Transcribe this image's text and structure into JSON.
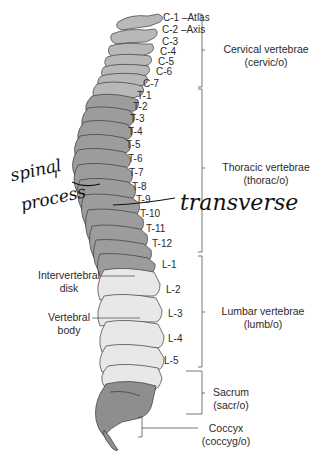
{
  "diagram": {
    "vertebra_labels": {
      "cervical": [
        "C-1 –Atlas",
        "C-2 –Axis",
        "C-3",
        "C-4",
        "C-5",
        "C-6",
        "C-7"
      ],
      "thoracic": [
        "T-1",
        "T-2",
        "T-3",
        "T-4",
        "T-5",
        "T-6",
        "T-7",
        "T-8",
        "T-9",
        "T-10",
        "T-11",
        "T-12"
      ],
      "lumbar": [
        "L-1",
        "L-2",
        "L-3",
        "L-4",
        "L-5"
      ]
    },
    "regions": {
      "cervical": {
        "name": "Cervical vertebrae",
        "root": "(cervic/o)"
      },
      "thoracic": {
        "name": "Thoracic vertebrae",
        "root": "(thorac/o)"
      },
      "lumbar": {
        "name": "Lumbar vertebrae",
        "root": "(lumb/o)"
      },
      "sacrum": {
        "name": "Sacrum",
        "root": "(sacr/o)"
      },
      "coccyx": {
        "name": "Coccyx",
        "root": "(coccyg/o)"
      }
    },
    "callouts": {
      "intervertebral_disk": [
        "Intervertebral",
        "disk"
      ],
      "vertebral_body": [
        "Vertebral",
        "body"
      ]
    },
    "handwritten": {
      "spinal_process": [
        "spinal",
        "process"
      ],
      "transverse": "transverse"
    },
    "colors": {
      "cervical": "#b8b8b8",
      "thoracic": "#9c9c9c",
      "lumbar": "#e8e8e8",
      "sacrum": "#8e8e8e",
      "outline": "#3a3a3a",
      "bracket": "#555555"
    }
  }
}
